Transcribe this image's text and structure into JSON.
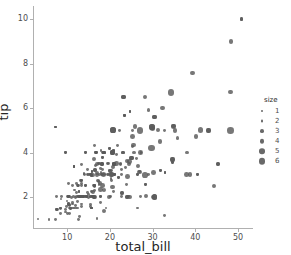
{
  "chart_data": {
    "type": "scatter",
    "title": "",
    "xlabel": "total_bill",
    "ylabel": "tip",
    "xlim": [
      2.0,
      53.5
    ],
    "ylim": [
      0.6,
      10.6
    ],
    "xticks": [
      10,
      20,
      30,
      40,
      50
    ],
    "yticks": [
      2,
      4,
      6,
      8,
      10
    ],
    "xtick_labels": [
      "10",
      "20",
      "30",
      "40",
      "50"
    ],
    "ytick_labels": [
      "2",
      "4",
      "6",
      "8",
      "10"
    ],
    "grid": false,
    "legend": {
      "title": "size",
      "position": "right",
      "entries": [
        {
          "label": "1",
          "marker_px": 2.0
        },
        {
          "label": "2",
          "marker_px": 2.9
        },
        {
          "label": "3",
          "marker_px": 3.8
        },
        {
          "label": "4",
          "marker_px": 4.7
        },
        {
          "label": "5",
          "marker_px": 5.6
        },
        {
          "label": "6",
          "marker_px": 6.5
        }
      ]
    },
    "size_encoding": {
      "field": "size",
      "min": 1,
      "max": 6
    },
    "marker_color": "#595959",
    "points": [
      [
        16.99,
        1.01,
        2
      ],
      [
        10.34,
        1.66,
        3
      ],
      [
        21.01,
        3.5,
        3
      ],
      [
        23.68,
        3.31,
        2
      ],
      [
        24.59,
        3.61,
        4
      ],
      [
        25.29,
        4.71,
        4
      ],
      [
        8.77,
        2.0,
        2
      ],
      [
        26.88,
        3.12,
        4
      ],
      [
        15.04,
        1.96,
        2
      ],
      [
        14.78,
        3.23,
        2
      ],
      [
        10.27,
        1.71,
        2
      ],
      [
        35.26,
        5.0,
        4
      ],
      [
        15.42,
        1.57,
        2
      ],
      [
        18.43,
        3.0,
        4
      ],
      [
        14.83,
        3.02,
        2
      ],
      [
        21.58,
        3.92,
        2
      ],
      [
        10.33,
        1.67,
        3
      ],
      [
        16.29,
        3.71,
        3
      ],
      [
        16.97,
        3.5,
        3
      ],
      [
        20.65,
        3.35,
        3
      ],
      [
        17.92,
        4.08,
        2
      ],
      [
        20.29,
        2.75,
        2
      ],
      [
        15.77,
        2.23,
        2
      ],
      [
        39.42,
        7.58,
        4
      ],
      [
        19.82,
        3.18,
        2
      ],
      [
        17.81,
        2.34,
        4
      ],
      [
        13.37,
        2.0,
        2
      ],
      [
        12.69,
        2.0,
        2
      ],
      [
        21.7,
        4.3,
        2
      ],
      [
        19.65,
        3.0,
        2
      ],
      [
        9.55,
        1.45,
        2
      ],
      [
        18.35,
        2.5,
        4
      ],
      [
        15.06,
        3.0,
        2
      ],
      [
        20.69,
        2.45,
        4
      ],
      [
        17.78,
        3.27,
        2
      ],
      [
        24.06,
        3.6,
        3
      ],
      [
        16.31,
        2.0,
        3
      ],
      [
        16.93,
        3.07,
        3
      ],
      [
        18.69,
        2.31,
        3
      ],
      [
        31.27,
        5.0,
        3
      ],
      [
        16.04,
        2.24,
        3
      ],
      [
        17.46,
        2.54,
        2
      ],
      [
        13.94,
        3.06,
        2
      ],
      [
        9.68,
        1.32,
        2
      ],
      [
        30.4,
        5.6,
        4
      ],
      [
        18.29,
        3.0,
        2
      ],
      [
        22.23,
        5.0,
        2
      ],
      [
        32.4,
        6.0,
        4
      ],
      [
        28.55,
        2.05,
        3
      ],
      [
        18.04,
        3.0,
        2
      ],
      [
        12.54,
        2.5,
        2
      ],
      [
        10.29,
        2.6,
        2
      ],
      [
        34.81,
        5.2,
        4
      ],
      [
        9.94,
        1.56,
        2
      ],
      [
        25.56,
        4.34,
        4
      ],
      [
        19.49,
        3.51,
        2
      ],
      [
        38.01,
        3.0,
        4
      ],
      [
        26.41,
        1.5,
        2
      ],
      [
        11.24,
        1.76,
        2
      ],
      [
        48.27,
        6.73,
        4
      ],
      [
        20.29,
        3.21,
        2
      ],
      [
        13.81,
        2.0,
        2
      ],
      [
        11.02,
        1.98,
        2
      ],
      [
        18.29,
        3.76,
        2
      ],
      [
        17.59,
        2.64,
        3
      ],
      [
        20.08,
        3.15,
        3
      ],
      [
        16.45,
        2.47,
        2
      ],
      [
        3.07,
        1.0,
        1
      ],
      [
        20.23,
        2.01,
        2
      ],
      [
        15.01,
        2.09,
        2
      ],
      [
        12.02,
        1.97,
        2
      ],
      [
        17.07,
        3.0,
        3
      ],
      [
        26.86,
        3.14,
        2
      ],
      [
        25.28,
        5.0,
        2
      ],
      [
        14.73,
        2.2,
        2
      ],
      [
        10.51,
        1.25,
        2
      ],
      [
        17.92,
        3.08,
        2
      ],
      [
        27.2,
        4.0,
        4
      ],
      [
        22.76,
        3.0,
        2
      ],
      [
        17.29,
        2.71,
        2
      ],
      [
        19.44,
        3.0,
        2
      ],
      [
        16.66,
        3.4,
        2
      ],
      [
        10.07,
        1.83,
        1
      ],
      [
        32.68,
        5.0,
        2
      ],
      [
        15.98,
        2.03,
        2
      ],
      [
        34.83,
        5.17,
        4
      ],
      [
        13.03,
        2.0,
        2
      ],
      [
        18.28,
        4.0,
        2
      ],
      [
        24.71,
        5.85,
        2
      ],
      [
        21.16,
        3.0,
        2
      ],
      [
        28.97,
        3.0,
        2
      ],
      [
        22.49,
        3.5,
        2
      ],
      [
        5.75,
        1.0,
        2
      ],
      [
        16.32,
        4.3,
        2
      ],
      [
        22.75,
        3.25,
        2
      ],
      [
        40.17,
        4.73,
        4
      ],
      [
        27.28,
        4.0,
        2
      ],
      [
        12.03,
        1.5,
        2
      ],
      [
        21.01,
        3.0,
        2
      ],
      [
        12.46,
        1.5,
        2
      ],
      [
        11.35,
        2.5,
        2
      ],
      [
        15.38,
        3.0,
        2
      ],
      [
        44.3,
        2.5,
        3
      ],
      [
        22.42,
        3.48,
        2
      ],
      [
        20.92,
        4.08,
        2
      ],
      [
        15.36,
        1.64,
        2
      ],
      [
        20.49,
        4.06,
        2
      ],
      [
        25.21,
        4.29,
        2
      ],
      [
        18.24,
        3.76,
        2
      ],
      [
        14.31,
        4.0,
        2
      ],
      [
        14.0,
        3.0,
        2
      ],
      [
        7.25,
        1.0,
        2
      ],
      [
        38.07,
        4.0,
        3
      ],
      [
        23.95,
        2.55,
        2
      ],
      [
        25.71,
        4.0,
        3
      ],
      [
        17.31,
        3.5,
        2
      ],
      [
        29.93,
        5.07,
        4
      ],
      [
        10.65,
        1.5,
        2
      ],
      [
        12.43,
        1.8,
        2
      ],
      [
        24.08,
        2.92,
        4
      ],
      [
        11.69,
        2.31,
        2
      ],
      [
        13.42,
        1.68,
        2
      ],
      [
        14.26,
        2.5,
        2
      ],
      [
        15.95,
        2.0,
        2
      ],
      [
        12.48,
        2.52,
        2
      ],
      [
        29.8,
        4.2,
        6
      ],
      [
        8.52,
        1.48,
        2
      ],
      [
        14.52,
        2.0,
        2
      ],
      [
        11.38,
        2.0,
        2
      ],
      [
        22.82,
        2.18,
        3
      ],
      [
        19.08,
        1.5,
        2
      ],
      [
        20.27,
        2.83,
        2
      ],
      [
        11.17,
        1.5,
        2
      ],
      [
        12.26,
        2.0,
        2
      ],
      [
        18.26,
        3.25,
        2
      ],
      [
        8.51,
        1.25,
        2
      ],
      [
        10.33,
        2.0,
        2
      ],
      [
        14.15,
        2.0,
        2
      ],
      [
        16.0,
        2.0,
        2
      ],
      [
        13.16,
        2.75,
        2
      ],
      [
        17.47,
        3.5,
        2
      ],
      [
        34.3,
        6.7,
        6
      ],
      [
        41.19,
        5.0,
        5
      ],
      [
        27.05,
        5.0,
        6
      ],
      [
        16.43,
        2.3,
        2
      ],
      [
        8.35,
        1.5,
        2
      ],
      [
        18.64,
        1.36,
        3
      ],
      [
        11.87,
        1.63,
        2
      ],
      [
        19.67,
        3.5,
        2
      ],
      [
        11.61,
        3.39,
        2
      ],
      [
        15.69,
        3.0,
        3
      ],
      [
        13.13,
        2.0,
        2
      ],
      [
        12.76,
        2.23,
        2
      ],
      [
        11.24,
        1.68,
        2
      ],
      [
        14.26,
        2.5,
        2
      ],
      [
        12.24,
        2.6,
        2
      ],
      [
        14.52,
        2.0,
        2
      ],
      [
        16.4,
        2.5,
        2
      ],
      [
        20.9,
        3.5,
        3
      ],
      [
        18.15,
        3.5,
        3
      ],
      [
        23.33,
        5.65,
        2
      ],
      [
        24.71,
        5.85,
        2
      ],
      [
        21.16,
        3.0,
        2
      ],
      [
        13.51,
        2.0,
        2
      ],
      [
        18.71,
        4.0,
        3
      ],
      [
        20.92,
        4.08,
        2
      ],
      [
        14.31,
        4.0,
        2
      ],
      [
        22.12,
        2.88,
        2
      ],
      [
        24.01,
        2.0,
        4
      ],
      [
        15.69,
        1.5,
        2
      ],
      [
        11.61,
        3.39,
        2
      ],
      [
        10.77,
        1.47,
        2
      ],
      [
        15.53,
        3.0,
        2
      ],
      [
        10.07,
        1.25,
        2
      ],
      [
        12.6,
        1.0,
        2
      ],
      [
        32.83,
        1.17,
        2
      ],
      [
        35.83,
        4.67,
        3
      ],
      [
        29.03,
        5.92,
        3
      ],
      [
        27.18,
        2.0,
        2
      ],
      [
        22.67,
        2.0,
        2
      ],
      [
        17.82,
        1.75,
        2
      ],
      [
        18.78,
        3.0,
        2
      ],
      [
        20.45,
        3.0,
        4
      ],
      [
        13.28,
        2.72,
        2
      ],
      [
        7.51,
        2.0,
        2
      ],
      [
        26.59,
        3.41,
        3
      ],
      [
        26.29,
        3.71,
        2
      ],
      [
        30.06,
        2.0,
        3
      ],
      [
        25.89,
        5.16,
        4
      ],
      [
        48.33,
        9.0,
        4
      ],
      [
        13.27,
        2.5,
        2
      ],
      [
        28.17,
        6.5,
        3
      ],
      [
        12.9,
        1.1,
        2
      ],
      [
        28.15,
        3.0,
        5
      ],
      [
        11.59,
        1.5,
        2
      ],
      [
        7.74,
        1.44,
        2
      ],
      [
        30.14,
        3.09,
        4
      ],
      [
        12.16,
        2.2,
        2
      ],
      [
        13.42,
        3.48,
        2
      ],
      [
        8.58,
        1.92,
        1
      ],
      [
        15.98,
        3.0,
        3
      ],
      [
        13.42,
        1.58,
        2
      ],
      [
        16.27,
        2.5,
        2
      ],
      [
        10.09,
        2.0,
        2
      ],
      [
        20.45,
        3.0,
        4
      ],
      [
        13.28,
        2.72,
        2
      ],
      [
        22.12,
        2.88,
        2
      ],
      [
        24.01,
        2.0,
        4
      ],
      [
        15.69,
        3.0,
        3
      ],
      [
        11.61,
        3.39,
        2
      ],
      [
        10.77,
        1.47,
        2
      ],
      [
        15.53,
        3.0,
        2
      ],
      [
        50.81,
        10.0,
        3
      ],
      [
        15.81,
        3.16,
        2
      ],
      [
        7.25,
        5.15,
        2
      ],
      [
        31.85,
        3.18,
        2
      ],
      [
        16.82,
        4.0,
        2
      ],
      [
        32.9,
        3.11,
        2
      ],
      [
        17.89,
        2.0,
        2
      ],
      [
        14.48,
        2.0,
        2
      ],
      [
        9.6,
        4.0,
        2
      ],
      [
        34.63,
        3.55,
        2
      ],
      [
        34.65,
        3.68,
        4
      ],
      [
        23.33,
        5.65,
        2
      ],
      [
        45.35,
        3.5,
        3
      ],
      [
        23.17,
        6.5,
        4
      ],
      [
        40.55,
        3.0,
        2
      ],
      [
        20.69,
        5.0,
        5
      ],
      [
        20.9,
        3.5,
        3
      ],
      [
        30.46,
        2.0,
        5
      ],
      [
        18.15,
        3.5,
        3
      ],
      [
        23.1,
        4.0,
        3
      ],
      [
        15.69,
        1.5,
        2
      ],
      [
        19.81,
        4.19,
        2
      ],
      [
        28.44,
        2.56,
        2
      ],
      [
        15.48,
        2.02,
        2
      ],
      [
        16.58,
        4.0,
        2
      ],
      [
        7.56,
        1.44,
        2
      ],
      [
        10.34,
        2.0,
        2
      ],
      [
        43.11,
        5.0,
        4
      ],
      [
        13.0,
        2.0,
        2
      ],
      [
        13.51,
        2.0,
        2
      ],
      [
        18.71,
        4.0,
        3
      ],
      [
        12.74,
        2.01,
        2
      ],
      [
        13.0,
        2.0,
        2
      ],
      [
        16.4,
        2.5,
        2
      ],
      [
        20.53,
        4.0,
        4
      ],
      [
        16.47,
        3.23,
        3
      ],
      [
        26.43,
        3.0,
        2
      ],
      [
        29.85,
        5.14,
        5
      ],
      [
        25.0,
        3.75,
        4
      ],
      [
        38.73,
        3.0,
        4
      ],
      [
        24.27,
        2.03,
        2
      ],
      [
        12.76,
        2.23,
        2
      ],
      [
        30.4,
        5.6,
        4
      ],
      [
        20.53,
        4.0,
        4
      ],
      [
        22.82,
        2.18,
        3
      ],
      [
        17.26,
        2.74,
        3
      ],
      [
        24.55,
        2.0,
        4
      ],
      [
        19.77,
        2.0,
        4
      ],
      [
        29.85,
        5.14,
        5
      ],
      [
        48.17,
        5.0,
        6
      ],
      [
        25.0,
        3.75,
        4
      ],
      [
        13.39,
        2.61,
        2
      ],
      [
        16.49,
        2.0,
        4
      ],
      [
        21.5,
        3.5,
        4
      ],
      [
        12.66,
        2.5,
        2
      ],
      [
        16.21,
        2.0,
        3
      ],
      [
        13.81,
        2.0,
        2
      ],
      [
        17.51,
        3.0,
        2
      ],
      [
        24.52,
        3.48,
        3
      ],
      [
        20.76,
        2.24,
        2
      ],
      [
        31.71,
        4.5,
        4
      ],
      [
        10.59,
        1.61,
        2
      ],
      [
        10.63,
        2.0,
        2
      ],
      [
        50.81,
        10.0,
        3
      ],
      [
        15.81,
        3.16,
        2
      ],
      [
        7.25,
        5.15,
        2
      ],
      [
        31.85,
        3.18,
        2
      ],
      [
        16.82,
        4.0,
        2
      ],
      [
        32.9,
        3.11,
        2
      ],
      [
        17.89,
        2.0,
        2
      ],
      [
        14.48,
        2.0,
        2
      ],
      [
        9.6,
        4.0,
        2
      ],
      [
        34.63,
        3.55,
        2
      ],
      [
        34.65,
        3.68,
        4
      ],
      [
        23.33,
        5.65,
        2
      ],
      [
        45.35,
        3.5,
        3
      ],
      [
        23.17,
        6.5,
        4
      ],
      [
        40.55,
        3.0,
        2
      ],
      [
        20.69,
        5.0,
        5
      ],
      [
        20.9,
        3.5,
        3
      ],
      [
        30.46,
        2.0,
        5
      ],
      [
        18.15,
        3.5,
        3
      ],
      [
        23.1,
        4.0,
        3
      ],
      [
        15.69,
        1.5,
        2
      ],
      [
        19.81,
        4.19,
        2
      ],
      [
        28.44,
        2.56,
        2
      ],
      [
        15.48,
        2.02,
        2
      ],
      [
        16.58,
        4.0,
        2
      ],
      [
        7.56,
        1.44,
        2
      ],
      [
        10.34,
        2.0,
        2
      ],
      [
        43.11,
        5.0,
        4
      ],
      [
        13.0,
        2.0,
        2
      ],
      [
        13.51,
        2.0,
        2
      ],
      [
        18.71,
        4.0,
        3
      ],
      [
        12.74,
        2.01,
        2
      ],
      [
        13.0,
        2.0,
        2
      ],
      [
        16.4,
        2.5,
        2
      ],
      [
        20.53,
        4.0,
        4
      ],
      [
        16.47,
        3.23,
        3
      ],
      [
        26.43,
        3.0,
        2
      ]
    ]
  }
}
